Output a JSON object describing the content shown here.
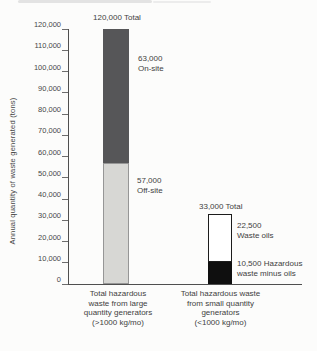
{
  "figure": {
    "background": "#fcfcfb",
    "axis_color": "#4f4f4f",
    "text_color": "#414141"
  },
  "chart_data": {
    "type": "bar",
    "subtype": "stacked-vertical",
    "title": "",
    "xlabel": "",
    "ylabel": "Annual quantity of waste generated (tons)",
    "ylim": [
      0,
      120000
    ],
    "ytick_step": 10000,
    "ytick_labels": [
      "0",
      "10,000",
      "20,000",
      "30,000",
      "40,000",
      "50,000",
      "60,000",
      "70,000",
      "80,000",
      "90,000",
      "100,000",
      "110,000",
      "120,000"
    ],
    "grid": false,
    "legend_position": "none",
    "bars": [
      {
        "category": "Total hazardous\nwaste from large\nquantity generators\n(>1000 kg/mo)",
        "total": 120000,
        "total_label": "120,000 Total",
        "segments": [
          {
            "name": "Off-site",
            "value": 57000,
            "label": "57,000\nOff-site",
            "color": "#d7d7d4",
            "border": "#969696"
          },
          {
            "name": "On-site",
            "value": 63000,
            "label": "63,000\nOn-site",
            "color": "#565658",
            "border": null
          }
        ]
      },
      {
        "category": "Total hazardous waste\nfrom small quantity\ngenerators\n(<1000 kg/mo)",
        "total": 33000,
        "total_label": "33,000 Total",
        "segments": [
          {
            "name": "Hazardous waste minus oils",
            "value": 10500,
            "label": "10,500 Hazardous\nwaste minus oils",
            "color": "#0f0f0f",
            "border": "#0f0f0f"
          },
          {
            "name": "Waste oils",
            "value": 22500,
            "label": "22,500\nWaste oils",
            "color": "#ffffff",
            "border": "#1c1c1c"
          }
        ]
      }
    ]
  }
}
